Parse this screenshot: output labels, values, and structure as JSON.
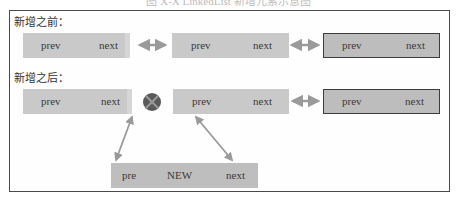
{
  "caption": "图 X-X  LinkedList 新增元素示意图",
  "sections": {
    "before": {
      "label": "新增之前：",
      "nodes": [
        {
          "prev": "prev",
          "next": "next",
          "style": "light"
        },
        {
          "prev": "prev",
          "next": "next",
          "style": "light"
        },
        {
          "prev": "prev",
          "next": "next",
          "style": "dark"
        }
      ]
    },
    "after": {
      "label": "新增之后：",
      "nodes": [
        {
          "prev": "prev",
          "next": "next",
          "style": "light"
        },
        {
          "prev": "prev",
          "next": "next",
          "style": "light"
        },
        {
          "prev": "prev",
          "next": "next",
          "style": "dark"
        }
      ],
      "broken_link_icon": "x-circle-icon",
      "new_node": {
        "pre": "pre",
        "label": "NEW",
        "next": "next"
      }
    }
  },
  "colors": {
    "node_fill": "#c9c9c9",
    "node_dark_border": "#3c3c3c",
    "arrow": "#9a9a9a",
    "x_circle": "#555555",
    "frame": "#4a4a4a"
  }
}
